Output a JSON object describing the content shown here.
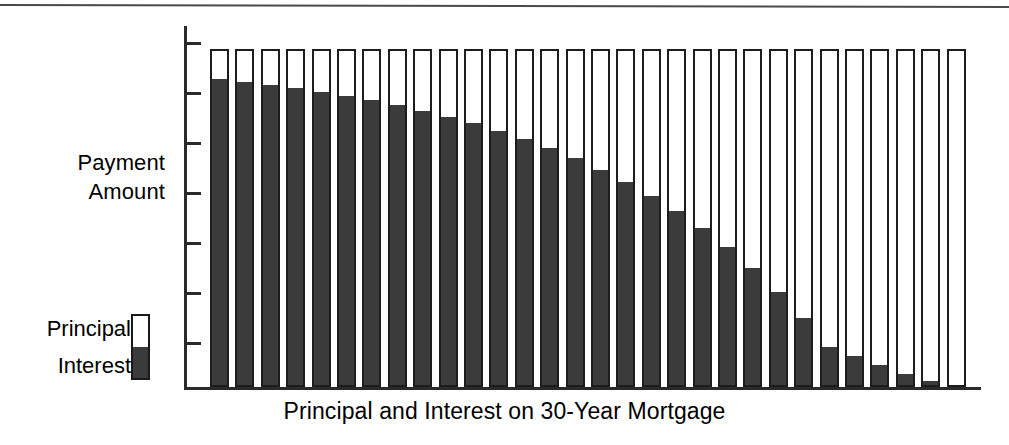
{
  "figure": {
    "caption": "Principal and Interest on 30-Year Mortgage",
    "y_axis_label": "Payment\nAmount"
  },
  "legend": {
    "principal_label": "Principal",
    "interest_label": "Interest",
    "swatch_top_color": "#ffffff",
    "swatch_bottom_color": "#3b3b3b",
    "outline_color": "#1d1d1d"
  },
  "chart_data": {
    "type": "bar",
    "title": "Principal and Interest on 30-Year Mortgage",
    "subtitle": "",
    "xlabel": "Principal and Interest on 30-Year Mortgage",
    "ylabel": "Payment Amount",
    "stacked": true,
    "grid": false,
    "legend_position": "left",
    "ylim": [
      0,
      100
    ],
    "y_tick_count": 7,
    "y_tick_labels": [],
    "x_tick_labels": [],
    "categories": [
      "1",
      "2",
      "3",
      "4",
      "5",
      "6",
      "7",
      "8",
      "9",
      "10",
      "11",
      "12",
      "13",
      "14",
      "15",
      "16",
      "17",
      "18",
      "19",
      "20",
      "21",
      "22",
      "23",
      "24",
      "25",
      "26",
      "27",
      "28",
      "29",
      "30"
    ],
    "series": [
      {
        "name": "Interest",
        "color": "#3b3b3b",
        "values": [
          91.5,
          90.7,
          89.8,
          88.8,
          87.7,
          86.5,
          85.2,
          83.7,
          82.1,
          80.3,
          78.3,
          76.1,
          73.6,
          70.9,
          67.9,
          64.5,
          60.8,
          56.7,
          52.1,
          47.0,
          41.3,
          35.0,
          27.9,
          20.1,
          11.4,
          8.6,
          5.9,
          3.2,
          1.2,
          0.0
        ]
      },
      {
        "name": "Principal",
        "color": "#ffffff",
        "values": [
          8.5,
          9.3,
          10.2,
          11.2,
          12.3,
          13.5,
          14.8,
          16.3,
          17.9,
          19.7,
          21.7,
          23.9,
          26.4,
          29.1,
          32.1,
          35.5,
          39.2,
          43.3,
          47.9,
          53.0,
          58.7,
          65.0,
          72.1,
          79.9,
          88.6,
          91.4,
          94.1,
          96.8,
          98.8,
          100.0
        ]
      }
    ],
    "totals": [
      100,
      100,
      100,
      100,
      100,
      100,
      100,
      100,
      100,
      100,
      100,
      100,
      100,
      100,
      100,
      100,
      100,
      100,
      100,
      100,
      100,
      100,
      100,
      100,
      100,
      100,
      100,
      100,
      100,
      100
    ]
  },
  "geometry": {
    "bar_width_px": 19,
    "bar_pitch_px": 25.4,
    "bar_top_px": 23,
    "plot_height_px": 361
  }
}
